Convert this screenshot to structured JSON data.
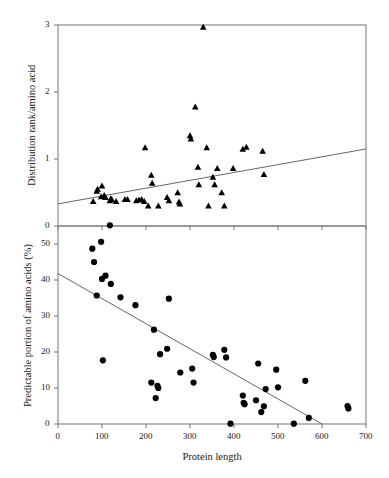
{
  "figure": {
    "background": "#ffffff",
    "frame_color": "#808080",
    "marker_color": "#000000",
    "trendline_color": "#666666"
  },
  "chart_data": [
    {
      "type": "scatter",
      "panel": "top",
      "title": "",
      "xlabel": "",
      "ylabel": "Distribution rank/amino acid",
      "xlim": [
        0,
        700
      ],
      "ylim": [
        0,
        3
      ],
      "xticks": [
        0,
        100,
        200,
        300,
        400,
        500,
        600,
        700
      ],
      "xticklabels": [
        "",
        "",
        "",
        "",
        "",
        "",
        "",
        ""
      ],
      "yticks": [
        0,
        1,
        2,
        3
      ],
      "yticklabels": [
        "0",
        "1",
        "2",
        "3"
      ],
      "grid": false,
      "legend": "none",
      "marker": "triangle",
      "points": [
        {
          "x": 80,
          "y": 0.37
        },
        {
          "x": 88,
          "y": 0.52
        },
        {
          "x": 90,
          "y": 0.55
        },
        {
          "x": 98,
          "y": 0.44
        },
        {
          "x": 100,
          "y": 0.6
        },
        {
          "x": 105,
          "y": 0.46
        },
        {
          "x": 108,
          "y": 0.43
        },
        {
          "x": 118,
          "y": 0.38
        },
        {
          "x": 120,
          "y": 0.41
        },
        {
          "x": 122,
          "y": 0.4
        },
        {
          "x": 132,
          "y": 0.37
        },
        {
          "x": 152,
          "y": 0.4
        },
        {
          "x": 158,
          "y": 0.4
        },
        {
          "x": 178,
          "y": 0.38
        },
        {
          "x": 184,
          "y": 0.39
        },
        {
          "x": 190,
          "y": 0.4
        },
        {
          "x": 196,
          "y": 0.37
        },
        {
          "x": 198,
          "y": 1.17
        },
        {
          "x": 205,
          "y": 0.3
        },
        {
          "x": 212,
          "y": 0.76
        },
        {
          "x": 214,
          "y": 0.64
        },
        {
          "x": 228,
          "y": 0.3
        },
        {
          "x": 248,
          "y": 0.43
        },
        {
          "x": 252,
          "y": 0.38
        },
        {
          "x": 272,
          "y": 0.5
        },
        {
          "x": 275,
          "y": 0.36
        },
        {
          "x": 277,
          "y": 0.33
        },
        {
          "x": 300,
          "y": 1.35
        },
        {
          "x": 302,
          "y": 1.3
        },
        {
          "x": 312,
          "y": 1.78
        },
        {
          "x": 318,
          "y": 0.88
        },
        {
          "x": 320,
          "y": 0.62
        },
        {
          "x": 330,
          "y": 2.97
        },
        {
          "x": 338,
          "y": 1.17
        },
        {
          "x": 342,
          "y": 0.3
        },
        {
          "x": 352,
          "y": 0.73
        },
        {
          "x": 356,
          "y": 0.62
        },
        {
          "x": 362,
          "y": 0.86
        },
        {
          "x": 372,
          "y": 0.5
        },
        {
          "x": 378,
          "y": 0.3
        },
        {
          "x": 398,
          "y": 0.86
        },
        {
          "x": 420,
          "y": 1.15
        },
        {
          "x": 428,
          "y": 1.18
        },
        {
          "x": 465,
          "y": 1.12
        },
        {
          "x": 468,
          "y": 0.77
        }
      ],
      "trendline": {
        "x0": 0,
        "y0": 0.33,
        "x1": 700,
        "y1": 1.15
      }
    },
    {
      "type": "scatter",
      "panel": "bottom",
      "title": "",
      "xlabel": "Protein length",
      "ylabel": "Predictable portion of amino acids (%)",
      "xlim": [
        0,
        700
      ],
      "ylim": [
        0,
        55
      ],
      "xticks": [
        0,
        100,
        200,
        300,
        400,
        500,
        600,
        700
      ],
      "xticklabels": [
        "0",
        "100",
        "200",
        "300",
        "400",
        "500",
        "600",
        "700"
      ],
      "yticks": [
        0,
        10,
        20,
        30,
        40,
        50
      ],
      "yticklabels": [
        "0",
        "10",
        "20",
        "30",
        "40",
        "50"
      ],
      "grid": false,
      "legend": "none",
      "marker": "circle",
      "points": [
        {
          "x": 78,
          "y": 48.7
        },
        {
          "x": 82,
          "y": 45.0
        },
        {
          "x": 88,
          "y": 35.7
        },
        {
          "x": 98,
          "y": 50.6
        },
        {
          "x": 100,
          "y": 40.3
        },
        {
          "x": 102,
          "y": 17.7
        },
        {
          "x": 108,
          "y": 41.2
        },
        {
          "x": 118,
          "y": 55.2
        },
        {
          "x": 120,
          "y": 38.9
        },
        {
          "x": 142,
          "y": 35.2
        },
        {
          "x": 176,
          "y": 33.0
        },
        {
          "x": 212,
          "y": 11.5
        },
        {
          "x": 218,
          "y": 26.2
        },
        {
          "x": 222,
          "y": 7.2
        },
        {
          "x": 226,
          "y": 10.6
        },
        {
          "x": 228,
          "y": 10.0
        },
        {
          "x": 232,
          "y": 19.4
        },
        {
          "x": 248,
          "y": 20.9
        },
        {
          "x": 252,
          "y": 34.8
        },
        {
          "x": 278,
          "y": 14.3
        },
        {
          "x": 305,
          "y": 15.4
        },
        {
          "x": 308,
          "y": 11.5
        },
        {
          "x": 352,
          "y": 19.2
        },
        {
          "x": 354,
          "y": 18.6
        },
        {
          "x": 378,
          "y": 20.6
        },
        {
          "x": 382,
          "y": 18.5
        },
        {
          "x": 392,
          "y": 0.1
        },
        {
          "x": 420,
          "y": 7.9
        },
        {
          "x": 422,
          "y": 5.9
        },
        {
          "x": 424,
          "y": 5.5
        },
        {
          "x": 450,
          "y": 6.6
        },
        {
          "x": 455,
          "y": 16.8
        },
        {
          "x": 462,
          "y": 3.3
        },
        {
          "x": 468,
          "y": 4.9
        },
        {
          "x": 472,
          "y": 9.7
        },
        {
          "x": 496,
          "y": 15.1
        },
        {
          "x": 500,
          "y": 10.2
        },
        {
          "x": 536,
          "y": 0.1
        },
        {
          "x": 562,
          "y": 12.0
        },
        {
          "x": 570,
          "y": 1.7
        },
        {
          "x": 658,
          "y": 5.0
        },
        {
          "x": 660,
          "y": 4.3
        }
      ],
      "trendline": {
        "x0": 0,
        "y0": 41.8,
        "x1": 600,
        "y1": 0.0
      }
    }
  ]
}
